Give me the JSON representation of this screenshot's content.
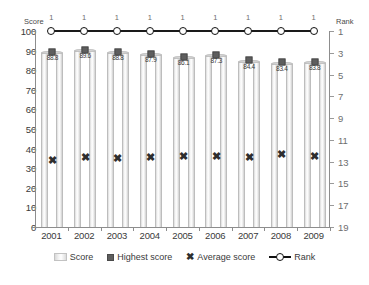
{
  "chart_data": {
    "type": "bar",
    "title": "",
    "xlabel": "",
    "ylabel": "Score",
    "y2label": "Rank",
    "categories": [
      "2001",
      "2002",
      "2003",
      "2004",
      "2005",
      "2006",
      "2007",
      "2008",
      "2009"
    ],
    "ylim": [
      0,
      100
    ],
    "yticks": [
      0,
      10,
      20,
      30,
      40,
      50,
      60,
      70,
      80,
      90,
      100
    ],
    "y2lim": [
      19,
      1
    ],
    "y2ticks": [
      1,
      3,
      5,
      7,
      9,
      11,
      13,
      15,
      17,
      19
    ],
    "y2_inverted": true,
    "grid": false,
    "legend_position": "bottom",
    "series": [
      {
        "name": "Score",
        "type": "bar",
        "axis": "left",
        "values": [
          88.8,
          89.6,
          88.8,
          87.9,
          86.1,
          87.3,
          84.4,
          83.4,
          83.8
        ],
        "labels": [
          "88.8",
          "89.6",
          "88.8",
          "87.9",
          "86.1",
          "87.3",
          "84.4",
          "83.4",
          "83.8"
        ]
      },
      {
        "name": "Highest score",
        "type": "scatter",
        "axis": "left",
        "values": [
          89.3,
          90.2,
          89.3,
          88.4,
          86.6,
          87.9,
          85.2,
          84.0,
          84.4
        ]
      },
      {
        "name": "Average score",
        "type": "scatter",
        "axis": "left",
        "values": [
          34.4,
          35.5,
          35.2,
          35.8,
          36.4,
          36.0,
          35.5,
          37.4,
          36.3
        ]
      },
      {
        "name": "Rank",
        "type": "line",
        "axis": "right",
        "values": [
          1,
          1,
          1,
          1,
          1,
          1,
          1,
          1,
          1
        ],
        "labels": [
          "1",
          "1",
          "1",
          "1",
          "1",
          "1",
          "1",
          "1",
          "1"
        ]
      }
    ]
  },
  "axis": {
    "left_title": "Score",
    "right_title": "Rank"
  },
  "legend": {
    "items": [
      {
        "label": "Score",
        "marker": "bar-swatch-icon"
      },
      {
        "label": "Highest score",
        "marker": "square-marker-icon"
      },
      {
        "label": "Average score",
        "marker": "x-marker-icon"
      },
      {
        "label": "Rank",
        "marker": "line-circle-marker-icon"
      }
    ]
  },
  "colors": {
    "bar_fill": "#f2f2f2",
    "bar_edge": "#bdbdbd",
    "highest_marker": "#5e5e5e",
    "average_marker": "#2e2e2e",
    "rank_line": "#111111",
    "axis": "#8d8d8d",
    "text": "#3a3a3a",
    "right_axis_text": "#6e6e6e"
  }
}
